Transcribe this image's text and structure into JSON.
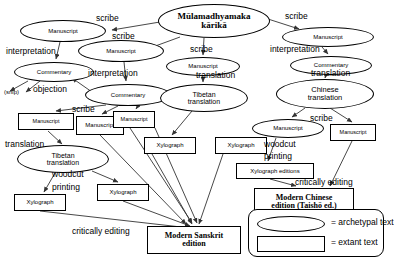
{
  "diagram": {
    "nodes": [
      {
        "id": "root",
        "label": "Mūlamadhyamaka\nkārikā",
        "shape": "ellipse",
        "x": 158,
        "y": 4,
        "w": 112,
        "h": 34,
        "bold": true,
        "size": 9
      },
      {
        "id": "ms_l1",
        "label": "Manuscript",
        "shape": "ellipse",
        "x": 20,
        "y": 20,
        "w": 86,
        "h": 22,
        "size": 6
      },
      {
        "id": "ms_c1",
        "label": "Manuscript",
        "shape": "ellipse",
        "x": 78,
        "y": 40,
        "w": 86,
        "h": 22,
        "size": 6
      },
      {
        "id": "comm_l1",
        "label": "Commentary",
        "shape": "ellipse",
        "x": 14,
        "y": 62,
        "w": 80,
        "h": 20,
        "size": 6
      },
      {
        "id": "comm_c1",
        "label": "Commentary",
        "shape": "ellipse",
        "x": 85,
        "y": 84,
        "w": 86,
        "h": 22,
        "size": 6
      },
      {
        "id": "ms_lb",
        "label": "Manuscript",
        "shape": "rect",
        "x": 18,
        "y": 113,
        "w": 56,
        "h": 17,
        "size": 5.5
      },
      {
        "id": "ms_cb1",
        "label": "Manuscript",
        "shape": "rect",
        "x": 76,
        "y": 116,
        "w": 48,
        "h": 19,
        "size": 6
      },
      {
        "id": "ms_cb2",
        "label": "Manuscript",
        "shape": "rect",
        "x": 113,
        "y": 111,
        "w": 42,
        "h": 17,
        "size": 5.5
      },
      {
        "id": "tib_l",
        "label": "Tibetan\ntranslation",
        "shape": "ellipse",
        "x": 17,
        "y": 145,
        "w": 92,
        "h": 28,
        "size": 7
      },
      {
        "id": "xylo_l",
        "label": "Xylograph",
        "shape": "rect",
        "x": 14,
        "y": 194,
        "w": 52,
        "h": 17,
        "size": 6
      },
      {
        "id": "xylo_c1",
        "label": "Xylograph",
        "shape": "rect",
        "x": 97,
        "y": 184,
        "w": 52,
        "h": 17,
        "size": 6
      },
      {
        "id": "ms_top_c",
        "label": "Manuscript",
        "shape": "ellipse",
        "x": 166,
        "y": 57,
        "w": 74,
        "h": 19,
        "size": 6
      },
      {
        "id": "tib_c",
        "label": "Tibetan\ntranslation",
        "shape": "ellipse",
        "x": 160,
        "y": 84,
        "w": 88,
        "h": 28,
        "size": 7
      },
      {
        "id": "xylo_c2",
        "label": "Xylograph",
        "shape": "rect",
        "x": 144,
        "y": 137,
        "w": 52,
        "h": 17,
        "size": 6
      },
      {
        "id": "xylo_c3",
        "label": "Xylograph",
        "shape": "rect",
        "x": 215,
        "y": 137,
        "w": 52,
        "h": 17,
        "size": 6
      },
      {
        "id": "ms_r1",
        "label": "Manuscript",
        "shape": "ellipse",
        "x": 282,
        "y": 27,
        "w": 92,
        "h": 20,
        "size": 6
      },
      {
        "id": "comm_r1",
        "label": "Commentary",
        "shape": "ellipse",
        "x": 290,
        "y": 56,
        "w": 82,
        "h": 19,
        "size": 6
      },
      {
        "id": "chin",
        "label": "Chinese\ntranslation",
        "shape": "ellipse",
        "x": 276,
        "y": 79,
        "w": 98,
        "h": 30,
        "size": 7.5
      },
      {
        "id": "ms_r2",
        "label": "Manuscript",
        "shape": "ellipse",
        "x": 252,
        "y": 119,
        "w": 72,
        "h": 19,
        "size": 6
      },
      {
        "id": "ms_r3",
        "label": "Manuscript",
        "shape": "rect",
        "x": 330,
        "y": 124,
        "w": 46,
        "h": 17,
        "size": 5.5
      },
      {
        "id": "xylo_ed",
        "label": "Xylograph editions",
        "shape": "rect",
        "x": 236,
        "y": 163,
        "w": 78,
        "h": 16,
        "size": 6
      },
      {
        "id": "chin_ed",
        "label": "Modern Chinese\nedition (Taishō ed.)",
        "shape": "rect",
        "x": 254,
        "y": 188,
        "w": 100,
        "h": 28,
        "bold": true,
        "size": 8
      },
      {
        "id": "skt_ed",
        "label": "Modern Sanskrit\nedition",
        "shape": "rect",
        "x": 147,
        "y": 226,
        "w": 94,
        "h": 28,
        "bold": true,
        "size": 8
      }
    ],
    "edge_labels": [
      {
        "id": "scribe1",
        "text": "scribe",
        "x": 96,
        "y": 13,
        "size": 8.5
      },
      {
        "id": "scribe2",
        "text": "scribe",
        "x": 112,
        "y": 31,
        "size": 8.5
      },
      {
        "id": "interpretation1",
        "text": "interpretation",
        "x": 6,
        "y": 46,
        "size": 8.5
      },
      {
        "id": "interpretation2",
        "text": "interpretation",
        "x": 88,
        "y": 68,
        "size": 8.5
      },
      {
        "id": "objection",
        "text": "objection",
        "x": 33,
        "y": 84,
        "size": 8.5
      },
      {
        "id": "snip",
        "text": "(snip)",
        "x": 4,
        "y": 89,
        "size": 6
      },
      {
        "id": "scribe3",
        "text": "scribe",
        "x": 72,
        "y": 104,
        "size": 8.5
      },
      {
        "id": "translation1",
        "text": "translation",
        "x": 5,
        "y": 139,
        "size": 8.5
      },
      {
        "id": "woodcut1",
        "text": "woodcut",
        "x": 52,
        "y": 169,
        "size": 8.5
      },
      {
        "id": "printing1",
        "text": "printing",
        "x": 52,
        "y": 182,
        "size": 8.5
      },
      {
        "id": "critically1",
        "text": "critically editing",
        "x": 72,
        "y": 226,
        "size": 8.5
      },
      {
        "id": "scribe4",
        "text": "scribe",
        "x": 190,
        "y": 44,
        "size": 8.5
      },
      {
        "id": "translation2",
        "text": "translation",
        "x": 196,
        "y": 70,
        "size": 8.5
      },
      {
        "id": "scribe5",
        "text": "scribe",
        "x": 285,
        "y": 11,
        "size": 8.5
      },
      {
        "id": "interpretation3",
        "text": "interpretation",
        "x": 270,
        "y": 44,
        "size": 8.5
      },
      {
        "id": "translation3",
        "text": "translation",
        "x": 311,
        "y": 68,
        "size": 8.5
      },
      {
        "id": "scribe6",
        "text": "scribe",
        "x": 310,
        "y": 113,
        "size": 8.5
      },
      {
        "id": "woodcut2",
        "text": "woodcut",
        "x": 264,
        "y": 139,
        "size": 8.5
      },
      {
        "id": "printing2",
        "text": "printing",
        "x": 264,
        "y": 151,
        "size": 8.5
      },
      {
        "id": "critically2",
        "text": "critically editing",
        "x": 295,
        "y": 177,
        "size": 8.5
      }
    ],
    "legend": {
      "items": [
        {
          "shape": "ellipse",
          "text": "= archetypal text"
        },
        {
          "shape": "rect",
          "text": "= extant text"
        }
      ]
    }
  }
}
